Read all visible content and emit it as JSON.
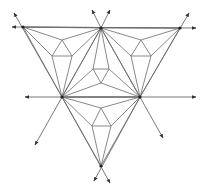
{
  "diagram": {
    "title": "",
    "colors": {
      "line": "#7a7a7a",
      "ray": "#6a6a6a",
      "vertex": "#222222",
      "background": "#ffffff"
    },
    "vertices": {
      "TL": [
        23,
        27
      ],
      "TC": [
        101,
        28
      ],
      "TR": [
        180,
        28
      ],
      "ML": [
        62,
        97
      ],
      "MR": [
        140,
        97
      ],
      "B": [
        101,
        166
      ]
    },
    "inner_points": {
      "LA": [
        62,
        40
      ],
      "LS1": [
        52,
        56
      ],
      "LS2": [
        72,
        56
      ],
      "RA": [
        141,
        40
      ],
      "RS1": [
        131,
        56
      ],
      "RS2": [
        151,
        56
      ],
      "CS1": [
        93,
        69
      ],
      "CS2": [
        109,
        69
      ],
      "CB": [
        101,
        83
      ],
      "BA": [
        101,
        108
      ],
      "BS1": [
        92,
        126
      ],
      "BS2": [
        111,
        126
      ]
    },
    "edges": [
      [
        "TL",
        "TC"
      ],
      [
        "TC",
        "TR"
      ],
      [
        "TL",
        "ML"
      ],
      [
        "ML",
        "B"
      ],
      [
        "TR",
        "MR"
      ],
      [
        "MR",
        "B"
      ],
      [
        "ML",
        "MR"
      ],
      [
        "TC",
        "ML"
      ],
      [
        "TC",
        "MR"
      ],
      [
        "TL",
        "LA"
      ],
      [
        "TC",
        "LA"
      ],
      [
        "LA",
        "LS1"
      ],
      [
        "LA",
        "LS2"
      ],
      [
        "LS1",
        "LS2"
      ],
      [
        "LS1",
        "ML"
      ],
      [
        "LS2",
        "ML"
      ],
      [
        "TL",
        "LS1"
      ],
      [
        "TC",
        "LS2"
      ],
      [
        "TR",
        "RA"
      ],
      [
        "TC",
        "RA"
      ],
      [
        "RA",
        "RS1"
      ],
      [
        "RA",
        "RS2"
      ],
      [
        "RS1",
        "RS2"
      ],
      [
        "RS1",
        "MR"
      ],
      [
        "RS2",
        "MR"
      ],
      [
        "TR",
        "RS2"
      ],
      [
        "TC",
        "RS1"
      ],
      [
        "CS1",
        "CS2"
      ],
      [
        "CS1",
        "CB"
      ],
      [
        "CS2",
        "CB"
      ],
      [
        "TC",
        "CS1"
      ],
      [
        "TC",
        "CS2"
      ],
      [
        "CB",
        "ML"
      ],
      [
        "CB",
        "MR"
      ],
      [
        "CS1",
        "ML"
      ],
      [
        "CS2",
        "MR"
      ],
      [
        "ML",
        "BA"
      ],
      [
        "MR",
        "BA"
      ],
      [
        "BA",
        "BS1"
      ],
      [
        "BA",
        "BS2"
      ],
      [
        "BS1",
        "BS2"
      ],
      [
        "BS1",
        "B"
      ],
      [
        "BS2",
        "B"
      ],
      [
        "ML",
        "BS1"
      ],
      [
        "MR",
        "BS2"
      ]
    ],
    "rays": [
      {
        "from": [
          180,
          28
        ],
        "to": [
          12,
          27
        ],
        "label": "top-line-left"
      },
      {
        "from": [
          23,
          27
        ],
        "to": [
          196,
          28
        ],
        "label": "top-line-right"
      },
      {
        "from": [
          140,
          97
        ],
        "to": [
          25,
          97
        ],
        "label": "mid-line-left"
      },
      {
        "from": [
          62,
          97
        ],
        "to": [
          196,
          97
        ],
        "label": "mid-line-right"
      },
      {
        "from": [
          62,
          97
        ],
        "to": [
          14,
          13
        ],
        "label": "left-up-ray"
      },
      {
        "from": [
          101,
          28
        ],
        "to": [
          92,
          10
        ],
        "label": "top-center-up-left"
      },
      {
        "from": [
          101,
          28
        ],
        "to": [
          110,
          10
        ],
        "label": "top-center-up-right"
      },
      {
        "from": [
          140,
          97
        ],
        "to": [
          189,
          13
        ],
        "label": "right-up-ray"
      },
      {
        "from": [
          101,
          28
        ],
        "to": [
          35,
          145
        ],
        "label": "left-down-ray"
      },
      {
        "from": [
          101,
          28
        ],
        "to": [
          163,
          138
        ],
        "label": "right-down-ray"
      },
      {
        "from": [
          62,
          97
        ],
        "to": [
          110,
          183
        ],
        "label": "bottom-right-down"
      },
      {
        "from": [
          140,
          97
        ],
        "to": [
          94,
          181
        ],
        "label": "bottom-left-down"
      }
    ]
  }
}
